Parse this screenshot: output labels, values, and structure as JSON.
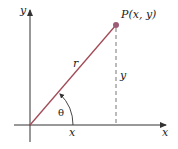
{
  "diagram": {
    "title": "",
    "labels": {
      "y_axis": "y",
      "x_axis": "x",
      "point": "P(x, y)",
      "radius": "r",
      "vertical_leg": "y",
      "horizontal_leg": "x",
      "angle": "θ"
    },
    "colors": {
      "axis": "#333333",
      "radius_line": "#a24a56",
      "point": "#9c5c76",
      "dashed": "#777777",
      "text": "#222222"
    },
    "geometry": {
      "origin": [
        30,
        125
      ],
      "point": [
        116,
        25
      ]
    }
  }
}
